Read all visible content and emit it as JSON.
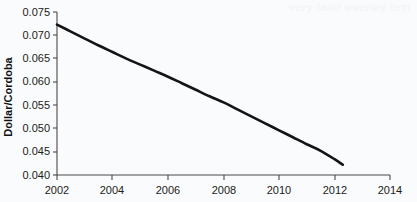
{
  "figure": {
    "background_color": "#fafbfc",
    "watermark_text": "very faint overlay text"
  },
  "chart_data": {
    "type": "line",
    "title": "",
    "subtitle": "",
    "xlabel": "",
    "ylabel": "Dollar/Cordoba",
    "xlim": [
      2002,
      2014
    ],
    "ylim": [
      0.04,
      0.075
    ],
    "grid": false,
    "legend": false,
    "legend_position": "none",
    "line_color": "#141414",
    "line_width": 2.6,
    "xticks": [
      2002,
      2004,
      2006,
      2008,
      2010,
      2012,
      2014
    ],
    "xtick_labels": [
      "2002",
      "2004",
      "2006",
      "2008",
      "2010",
      "2012",
      "2014"
    ],
    "yticks": [
      0.04,
      0.045,
      0.05,
      0.055,
      0.06,
      0.065,
      0.07,
      0.075
    ],
    "ytick_labels": [
      "0.040",
      "0.045",
      "0.050",
      "0.055",
      "0.060",
      "0.065",
      "0.070",
      "0.075"
    ],
    "series": [
      {
        "name": "Dollar per Cordoba",
        "x": [
          2002.0,
          2002.5,
          2003.0,
          2003.5,
          2004.0,
          2004.5,
          2005.0,
          2005.5,
          2006.0,
          2006.5,
          2007.0,
          2007.5,
          2008.0,
          2008.5,
          2009.0,
          2009.5,
          2010.0,
          2010.5,
          2011.0,
          2011.5,
          2012.0,
          2012.3
        ],
        "y": [
          0.0723,
          0.0708,
          0.0693,
          0.0678,
          0.0664,
          0.065,
          0.0637,
          0.0624,
          0.0611,
          0.0597,
          0.0583,
          0.0569,
          0.0556,
          0.0541,
          0.0526,
          0.0511,
          0.0496,
          0.0481,
          0.0466,
          0.0452,
          0.0434,
          0.0422
        ]
      }
    ]
  }
}
